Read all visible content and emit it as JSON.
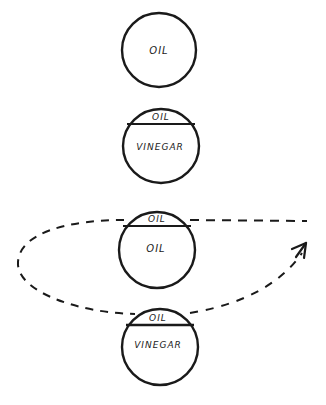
{
  "diagram": {
    "colors": {
      "ink": "#1a1a1a",
      "background": "#ffffff"
    },
    "containers": [
      {
        "id": "c1",
        "labels": {
          "main": "OIL"
        }
      },
      {
        "id": "c2",
        "labels": {
          "top": "OIL",
          "main": "VINEGAR"
        }
      },
      {
        "id": "c3",
        "labels": {
          "top": "OIL",
          "main": "OIL"
        }
      },
      {
        "id": "c4",
        "labels": {
          "top": "OIL",
          "main": "VINEGAR"
        }
      }
    ],
    "arrow": {
      "style": "dashed",
      "description": "loop from container 3 around left, back toward right"
    }
  }
}
